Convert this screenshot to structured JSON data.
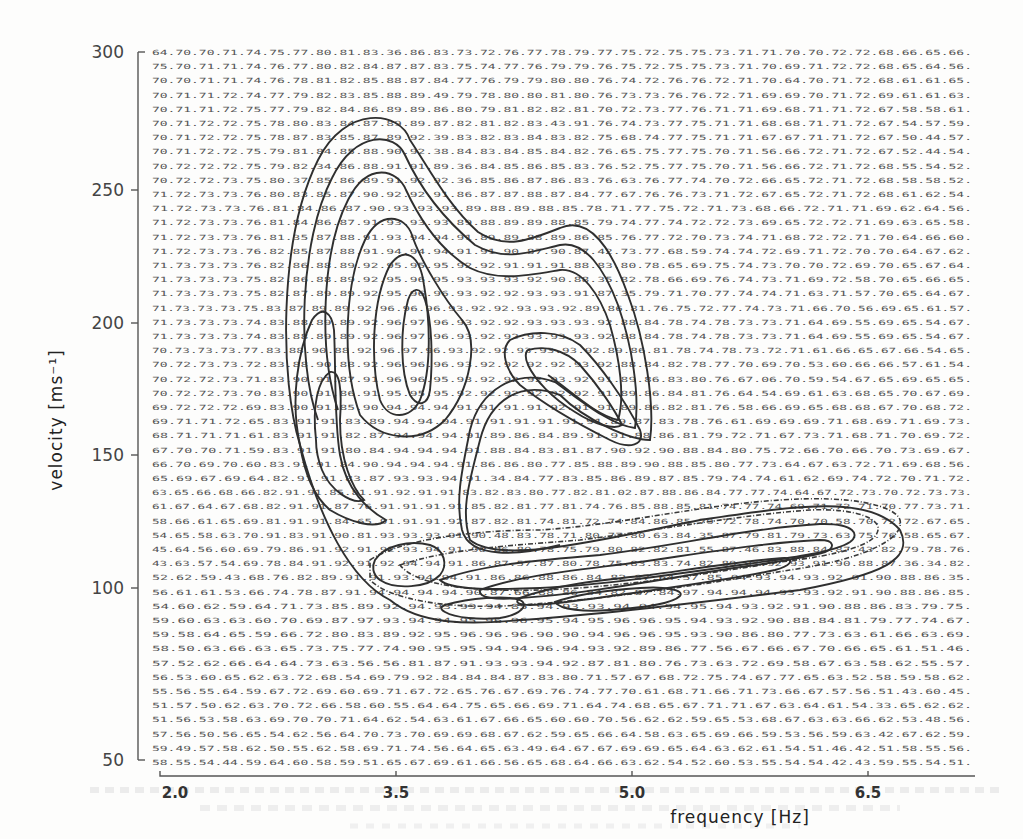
{
  "chart_data": {
    "type": "heatmap",
    "subtype": "contour plot over printed numeric grid",
    "title": "",
    "xlabel": "frequency [Hz]",
    "ylabel": "velocity [ms-1]",
    "xlim": [
      2.0,
      7.1
    ],
    "ylim": [
      50,
      300
    ],
    "x_ticks": [
      "2.0",
      "3.5",
      "5.0",
      "6.5"
    ],
    "x_tick_values": [
      2.0,
      3.5,
      5.0,
      6.5
    ],
    "y_ticks": [
      "300",
      "250",
      "200",
      "150",
      "100",
      "50"
    ],
    "y_tick_values": [
      300,
      250,
      200,
      150,
      100,
      50
    ],
    "grid": false,
    "legend": null,
    "grid_values_note": "50 rows x 28 columns of two-digit values printed as a background field; contours drawn over it",
    "grid_rows_sample": [
      "64.70.70.71.74.75.77.80.81.83.36.86.83.73.72.76.77.78.79.77.75.72.75.75.73.71.71.70.70.72.72.68.66.65.66.",
      "75.70.71.71.74.76.77.80.82.84.87.87.83.75.74.77.76.79.79.76.75.72.75.75.73.71.70.69.71.72.72.68.65.64.56.",
      "70.70.71.71.74.76.78.81.82.85.88.87.84.77.76.79.79.80.80.76.74.72.76.76.72.71.70.64.70.71.72.68.61.61.65.",
      "70.71.71.72.74.77.79.82.83.85.88.89.49.79.78.80.80.81.80.76.73.73.76.76.72.71.69.69.70.71.72.69.61.61.63.",
      "70.71.71.72.75.77.79.82.84.86.89.89.86.80.79.81.82.82.81.70.72.73.77.76.71.71.69.68.71.71.72.67.58.58.61.",
      "70.71.72.72.75.78.80.83.84.87.89.89.87.82.81.82.83.43.91.76.74.73.77.75.71.71.68.68.71.71.72.67.54.57.59.",
      "70.71.72.72.75.78.87.83.85.87.89.92.39.83.82.83.84.83.82.75.68.74.77.75.71.71.67.67.71.71.72.67.50.44.57.",
      "70.71.72.72.75.79.81.84.85.88.90.92.38.84.83.84.85.84.82.76.65.75.77.75.70.71.56.66.72.71.72.67.52.44.54.",
      "70.72.72.72.75.79.82.34.86.88.91.91.89.36.84.85.86.85.83.76.52.75.77.75.70.71.56.66.72.71.72.68.55.54.52.",
      "70.72.72.73.75.80.37.85.86.89.91.92.92.36.85.86.87.86.83.76.63.76.77.74.70.72.66.65.72.71.72.68.58.58.52.",
      "71.72.73.73.76.80.83.85.87.90.92.92.91.86.87.87.88.87.84.77.67.76.76.73.71.72.67.65.72.71.72.68.61.62.54.",
      "71.72.73.73.76.81.84.86.87.90.93.93.93.89.88.89.88.85.78.71.77.75.72.71.73.68.66.72.71.71.69.62.64.56.",
      "71.72.73.73.76.81.84.86.87.91.93.93.93.89.88.89.89.88.85.79.74.77.74.72.72.73.69.65.72.72.71.69.63.65.58.",
      "71.72.73.73.76.81.35.87.88.91.93.94.94.91.89.89.88.89.86.85.76.77.72.70.73.74.71.68.72.72.71.70.64.66.60.",
      "71.72.73.73.76.82.85.87.88.91.94.94.94.91.91.90.87.90.87.42.73.77.68.59.74.74.72.69.71.72.70.70.64.67.62.",
      "71.73.73.73.76.82.86.88.89.92.95.95.95.92.92.91.91.91.88.83.80.78.65.69.75.74.73.70.70.72.69.70.65.67.64.",
      "71.73.73.73.75.82.86.88.89.92.95.96.95.93.93.93.92.90.88.35.82.78.66.69.76.74.73.71.69.72.58.70.65.66.65.",
      "71.73.73.73.75.82.87.89.89.92.95.96.96.93.92.92.93.93.91.87.35.79.71.70.77.74.74.71.63.71.57.70.65.64.67.",
      "71.73.73.73.75.83.87.89.89.92.96.96.96.93.92.92.93.93.92.89.86.81.76.75.72.77.74.73.71.66.70.56.69.65.61.57.",
      "71.73.73.73.74.83.88.89.89.92.96.97.96.93.92.92.93.93.93.92.88.84.78.74.78.73.73.71.64.69.55.69.65.54.67.",
      "71.73.73.73.74.83.88.89.89.92.96.97.96.93.92.92.93.93.93.92.88.84.78.74.78.73.73.71.64.69.55.69.65.54.67.",
      "70.73.73.73.77.83.88.90.88.92.96.97.96.93.92.92.93.93.93.92.89.86.81.78.74.78.73.72.71.61.66.65.67.66.54.65.",
      "70.72.73.73.72.83.88.90.88.92.96.96.96.93.92.92.92.92.93.92.88.84.82.78.77.70.69.70.53.60.66.66.57.61.54.",
      "70.72.72.73.71.83.90.91.87.91.96.96.95.93.92.92.92.93.92.91.89.86.83.80.76.67.06.70.59.54.67.65.69.65.65.",
      "70.72.72.73.70.83.90.91.86.91.95.95.95.92.92.92.92.92.92.91.89.86.84.81.76.64.54.69.61.63.68.65.70.67.69.",
      "69.72.72.72.69.83.90.91.85.90.94.94.94.91.91.91.91.92.91.91.89.86.82.81.76.58.66.69.65.68.68.67.70.68.72.",
      "69.71.71.72.65.83.91.91.83.89.94.94.94.91.91.91.91.91.91.89.87.83.78.76.61.69.69.69.71.68.69.71.69.73.",
      "68.71.71.71.61.83.91.91.82.87.94.94.94.91.89.86.84.89.91.91.88.86.81.79.72.71.67.73.71.68.71.70.69.72.",
      "67.70.70.71.59.83.91.91.80.84.94.94.94.91.88.84.83.81.87.90.92.90.88.84.80.75.72.66.70.66.70.73.69.67.",
      "66.70.69.70.60.83.91.91.84.90.94.94.94.91.86.86.80.77.85.88.89.90.88.85.80.77.73.64.67.63.72.71.69.68.56.",
      "65.69.67.69.64.82.91.91.83.87.93.93.94.91.34.84.77.83.85.86.89.87.85.79.74.74.61.62.69.74.72.70.71.72.",
      "63.65.66.68.66.82.91.91.85.81.91.92.91.91.83.82.83.80.77.82.81.02.87.88.86.84.77.77.74.64.67.72.73.70.72.73.73.",
      "61.67.64.67.68.82.91.91.87.76.91.91.91.91.85.82.81.77.81.74.76.85.88.85.81.74.77.74.69.71.72.71.70.77.73.71.",
      "58.66.61.65.69.81.91.91.84.65.91.91.91.92.87.82.81.74.81.72.74.84.86.85.79.72.78.74.70.70.58.70.72.72.67.65.",
      "54.65.58.63.70.91.83.91.90.81.93.93.93.91.90.48.83.78.71.80.77.80.63.84.35.87.79.81.79.73.63.75.76.58.65.67.",
      "45.64.56.60.69.79.86.91.92.91.92.93.94.91.90.86.80.78.75.79.80.82.82.81.55.87.46.83.88.84.87.43.82.79.78.76.",
      "43.63.57.54.69.78.84.91.92.91.92.94.94.91.86.87.57.87.80.78.75.83.83.74.82.89.93.92.93.91.90.88.87.36.34.82.",
      "52.62.59.43.68.76.82.89.91.91.93.94.94.91.86.86.88.86.84.82.87.64.57.85.94.93.94.93.92.91.90.88.86.35.",
      "56.61.61.53.66.74.78.87.91.94.94.94.94.90.87.66.88.86.84.82.87.84.97.94.94.94.93.93.92.91.90.88.86.85.",
      "54.60.62.59.64.71.73.85.89.92.94.93.93.94.85.94.93.93.94.94.94.95.94.93.92.91.90.88.86.83.79.75.",
      "59.60.63.63.60.70.69.87.97.93.94.94.95.96.96.95.94.95.96.96.95.94.93.92.90.88.84.81.79.77.74.67.",
      "59.58.64.65.59.66.72.80.83.89.92.95.96.96.96.90.90.94.96.96.95.93.90.86.80.77.73.63.61.66.63.69.",
      "58.50.63.66.63.65.73.75.77.74.90.95.95.94.94.96.94.93.92.89.86.77.56.67.66.67.70.66.65.61.51.46.",
      "57.52.62.66.64.64.73.63.56.56.81.87.91.93.93.94.92.87.81.80.76.73.63.72.69.58.67.63.58.62.55.57.",
      "56.53.60.65.62.63.72.68.54.69.79.92.84.84.84.87.83.80.71.57.67.68.72.75.74.67.77.65.63.52.58.59.58.62.",
      "55.56.55.64.59.67.72.69.60.69.71.67.72.65.76.67.69.76.74.77.70.61.68.71.66.71.73.66.67.57.56.51.43.60.45.",
      "51.57.50.62.63.70.72.66.58.60.55.64.64.75.65.66.69.71.64.74.68.65.67.71.71.67.63.64.61.54.33.65.62.62.",
      "51.56.53.58.63.69.70.70.71.64.62.54.63.61.67.66.65.60.60.70.56.62.62.59.65.53.68.67.63.63.66.62.53.48.56.",
      "57.56.50.56.65.54.62.56.64.70.73.70.69.69.68.67.62.59.65.66.64.58.63.65.69.66.59.53.56.59.63.42.67.62.59.",
      "59.49.57.58.62.50.55.62.58.69.71.74.56.64.65.63.49.64.67.67.69.69.65.64.63.62.61.54.51.46.42.51.58.55.56.",
      "58.55.54.44.59.64.60.58.59.51.65.67.69.61.66.56.65.68.64.66.63.62.54.52.60.53.55.54.54.42.43.59.55.54.51."
    ],
    "features": [
      {
        "name": "peak A",
        "frequency_hz": 3.6,
        "velocity_ms": 195,
        "approx_max": 97
      },
      {
        "name": "peak B",
        "frequency_hz": 4.45,
        "velocity_ms": 190,
        "approx_max": 93
      },
      {
        "name": "peak C",
        "frequency_hz": 5.3,
        "velocity_ms": 96,
        "approx_max": 96
      },
      {
        "name": "side lobe",
        "frequency_hz": 3.05,
        "velocity_ms": 175,
        "approx_max": 91
      },
      {
        "name": "ridge",
        "frequency_hz": 6.3,
        "velocity_ms": 110,
        "approx_max": 93
      }
    ]
  },
  "axes": {
    "y_label": "velocity [ms⁻¹]",
    "x_label": "frequency [Hz]",
    "y_ticks": [
      "300",
      "250",
      "200",
      "150",
      "100",
      "50"
    ],
    "x_ticks": [
      "2.0",
      "3.5",
      "5.0",
      "6.5"
    ]
  }
}
